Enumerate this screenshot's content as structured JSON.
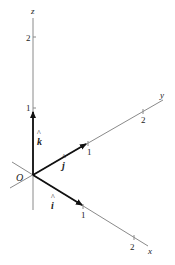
{
  "diagram": {
    "origin_label": "O",
    "axes": [
      {
        "name": "x",
        "label": "x",
        "ticks": [
          "1",
          "2"
        ]
      },
      {
        "name": "y",
        "label": "y",
        "ticks": [
          "1",
          "2"
        ]
      },
      {
        "name": "z",
        "label": "z",
        "ticks": [
          "1",
          "2"
        ]
      }
    ],
    "unit_vectors": [
      {
        "name": "i",
        "label": "î",
        "hat": "^",
        "letter": "i",
        "axis": "x"
      },
      {
        "name": "j",
        "label": "ĵ",
        "hat": "^",
        "letter": "j",
        "axis": "y"
      },
      {
        "name": "k",
        "label": "k̂",
        "hat": "^",
        "letter": "k",
        "axis": "z"
      }
    ],
    "colors": {
      "axis_line": "#888888",
      "vector": "#111111",
      "text": "#222222"
    }
  }
}
